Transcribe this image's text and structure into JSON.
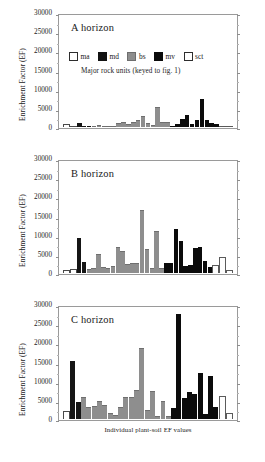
{
  "figure": {
    "y_axis_title": "Enrichment Factor (EF)",
    "y_ticks": [
      "30000",
      "25000",
      "20000",
      "15000",
      "10000",
      "5000",
      "0"
    ],
    "x_caption": "Individual plant-soil EF values",
    "legend_subtitle": "Major rock units (keyed to fig. 1)"
  },
  "legend": {
    "items": [
      {
        "key": "ma",
        "label": "ma",
        "color": "#ffffff"
      },
      {
        "key": "md",
        "label": "md",
        "color": "#121212"
      },
      {
        "key": "bs",
        "label": "bs",
        "color": "#8e8e8e"
      },
      {
        "key": "mv",
        "label": "mv",
        "color": "#0a0a0a"
      },
      {
        "key": "sct",
        "label": "sct",
        "color": "#ffffff"
      }
    ]
  },
  "panels": [
    {
      "id": "A",
      "title": "A horizon"
    },
    {
      "id": "B",
      "title": "B horizon"
    },
    {
      "id": "C",
      "title": "C horizon"
    }
  ],
  "chart_data": [
    {
      "type": "bar",
      "title": "A horizon",
      "xlabel": "",
      "ylabel": "Enrichment Factor (EF)",
      "ylim": [
        0,
        30000
      ],
      "yticks": [
        0,
        5000,
        10000,
        15000,
        20000,
        25000,
        30000
      ],
      "grid": false,
      "legend_position": "inside-top-left",
      "categories": [
        "ma",
        "md",
        "bs",
        "mv",
        "sct"
      ],
      "values": [
        {
          "group": "ma",
          "value": 900
        },
        {
          "group": "ma",
          "value": 350
        },
        {
          "group": "md",
          "value": 1150
        },
        {
          "group": "md",
          "value": 200
        },
        {
          "group": "md",
          "value": 180
        },
        {
          "group": "bs",
          "value": 260
        },
        {
          "group": "bs",
          "value": 520
        },
        {
          "group": "bs",
          "value": 300
        },
        {
          "group": "bs",
          "value": 240
        },
        {
          "group": "bs",
          "value": 180
        },
        {
          "group": "bs",
          "value": 1150
        },
        {
          "group": "bs",
          "value": 1300
        },
        {
          "group": "bs",
          "value": 900
        },
        {
          "group": "bs",
          "value": 1450
        },
        {
          "group": "bs",
          "value": 1900
        },
        {
          "group": "bs",
          "value": 2950
        },
        {
          "group": "bs",
          "value": 950
        },
        {
          "group": "bs",
          "value": 600
        },
        {
          "group": "bs",
          "value": 5300
        },
        {
          "group": "bs",
          "value": 1300
        },
        {
          "group": "bs",
          "value": 1250
        },
        {
          "group": "mv",
          "value": 400
        },
        {
          "group": "mv",
          "value": 700
        },
        {
          "group": "mv",
          "value": 2050
        },
        {
          "group": "mv",
          "value": 3150
        },
        {
          "group": "mv",
          "value": 700
        },
        {
          "group": "mv",
          "value": 1750
        },
        {
          "group": "mv",
          "value": 7450
        },
        {
          "group": "mv",
          "value": 1800
        },
        {
          "group": "mv",
          "value": 1150
        },
        {
          "group": "mv",
          "value": 700
        },
        {
          "group": "sct",
          "value": 300
        },
        {
          "group": "sct",
          "value": 260
        }
      ]
    },
    {
      "type": "bar",
      "title": "B horizon",
      "xlabel": "",
      "ylabel": "Enrichment Factor (EF)",
      "ylim": [
        0,
        30000
      ],
      "yticks": [
        0,
        5000,
        10000,
        15000,
        20000,
        25000,
        30000
      ],
      "grid": false,
      "legend_position": "none",
      "categories": [
        "ma",
        "md",
        "bs",
        "mv",
        "sct"
      ],
      "values": [
        {
          "group": "ma",
          "value": 800
        },
        {
          "group": "ma",
          "value": 950
        },
        {
          "group": "md",
          "value": 9250
        },
        {
          "group": "md",
          "value": 2850
        },
        {
          "group": "bs",
          "value": 1150
        },
        {
          "group": "bs",
          "value": 1350
        },
        {
          "group": "bs",
          "value": 5100
        },
        {
          "group": "bs",
          "value": 1600
        },
        {
          "group": "bs",
          "value": 1350
        },
        {
          "group": "bs",
          "value": 1750
        },
        {
          "group": "bs",
          "value": 7000
        },
        {
          "group": "bs",
          "value": 5800
        },
        {
          "group": "bs",
          "value": 2400
        },
        {
          "group": "bs",
          "value": 2650
        },
        {
          "group": "bs",
          "value": 2600
        },
        {
          "group": "bs",
          "value": 16700
        },
        {
          "group": "bs",
          "value": 6300
        },
        {
          "group": "bs",
          "value": 1300
        },
        {
          "group": "bs",
          "value": 11150
        },
        {
          "group": "bs",
          "value": 1400
        },
        {
          "group": "mv",
          "value": 2700
        },
        {
          "group": "mv",
          "value": 2600
        },
        {
          "group": "mv",
          "value": 11700
        },
        {
          "group": "mv",
          "value": 8400
        },
        {
          "group": "mv",
          "value": 1900
        },
        {
          "group": "mv",
          "value": 2100
        },
        {
          "group": "mv",
          "value": 6600
        },
        {
          "group": "mv",
          "value": 6900
        },
        {
          "group": "mv",
          "value": 3200
        },
        {
          "group": "mv",
          "value": 1500
        },
        {
          "group": "sct",
          "value": 2000
        },
        {
          "group": "sct",
          "value": 4150
        },
        {
          "group": "sct",
          "value": 700
        }
      ]
    },
    {
      "type": "bar",
      "title": "C horizon",
      "xlabel": "Individual plant-soil EF values",
      "ylabel": "Enrichment Factor (EF)",
      "ylim": [
        0,
        30000
      ],
      "yticks": [
        0,
        5000,
        10000,
        15000,
        20000,
        25000,
        30000
      ],
      "grid": false,
      "legend_position": "none",
      "categories": [
        "ma",
        "md",
        "bs",
        "mv",
        "sct"
      ],
      "values": [
        {
          "group": "ma",
          "value": 2100
        },
        {
          "group": "md",
          "value": 15350
        },
        {
          "group": "md",
          "value": 4500
        },
        {
          "group": "bs",
          "value": 5800
        },
        {
          "group": "bs",
          "value": 3200
        },
        {
          "group": "bs",
          "value": 3500
        },
        {
          "group": "bs",
          "value": 4800
        },
        {
          "group": "bs",
          "value": 3600
        },
        {
          "group": "bs",
          "value": 1700
        },
        {
          "group": "bs",
          "value": 1150
        },
        {
          "group": "bs",
          "value": 3300
        },
        {
          "group": "bs",
          "value": 5900
        },
        {
          "group": "bs",
          "value": 5800
        },
        {
          "group": "bs",
          "value": 7800
        },
        {
          "group": "bs",
          "value": 18800
        },
        {
          "group": "bs",
          "value": 2500
        },
        {
          "group": "bs",
          "value": 7500
        },
        {
          "group": "bs",
          "value": 800
        },
        {
          "group": "bs",
          "value": 4900
        },
        {
          "group": "bs",
          "value": 800
        },
        {
          "group": "mv",
          "value": 2900
        },
        {
          "group": "mv",
          "value": 28000
        },
        {
          "group": "mv",
          "value": 5600
        },
        {
          "group": "mv",
          "value": 7200
        },
        {
          "group": "mv",
          "value": 6600
        },
        {
          "group": "mv",
          "value": 12200
        },
        {
          "group": "mv",
          "value": 1400
        },
        {
          "group": "mv",
          "value": 11300
        },
        {
          "group": "mv",
          "value": 3100
        },
        {
          "group": "sct",
          "value": 6200
        },
        {
          "group": "sct",
          "value": 1600
        }
      ]
    }
  ]
}
